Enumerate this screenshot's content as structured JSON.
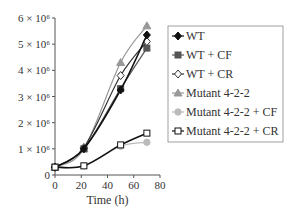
{
  "chart_data": {
    "type": "line",
    "title": "",
    "xlabel": "Time (h)",
    "ylabel": "",
    "xlim": [
      0,
      80
    ],
    "ylim": [
      0,
      6000000
    ],
    "x_ticks": [
      "0",
      "20",
      "40",
      "60",
      "80"
    ],
    "y_ticks": [
      "0",
      "1 × 10⁶",
      "2 × 10⁶",
      "3 × 10⁶",
      "4 × 10⁶",
      "5 × 10⁶",
      "6 × 10⁶"
    ],
    "grid": false,
    "legend_position": "right",
    "x": [
      0,
      22,
      50,
      70
    ],
    "series": [
      {
        "name": "WT",
        "marker": "filled-diamond",
        "color": "#111111",
        "values": [
          300000,
          1000000,
          3250000,
          5350000
        ]
      },
      {
        "name": "WT + CF",
        "marker": "filled-square",
        "color": "#555555",
        "values": [
          300000,
          1000000,
          3300000,
          4850000
        ]
      },
      {
        "name": "WT + CR",
        "marker": "open-diamond",
        "color": "#333333",
        "values": [
          300000,
          1050000,
          3800000,
          5100000
        ]
      },
      {
        "name": "Mutant 4-2-2",
        "marker": "filled-triangle",
        "color": "#999999",
        "values": [
          300000,
          1000000,
          4300000,
          5700000
        ]
      },
      {
        "name": "Mutant 4-2-2 + CF",
        "marker": "filled-circle",
        "color": "#bbbbbb",
        "values": [
          300000,
          350000,
          1100000,
          1250000
        ]
      },
      {
        "name": "Mutant 4-2-2 + CR",
        "marker": "open-square",
        "color": "#111111",
        "values": [
          300000,
          350000,
          1150000,
          1600000
        ]
      }
    ]
  }
}
